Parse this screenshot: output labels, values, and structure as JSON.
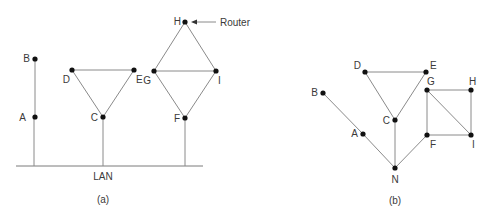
{
  "panels": [
    {
      "id": "a",
      "caption": "(a)",
      "lan_label": "LAN",
      "router_label": "Router",
      "nodes": [
        {
          "label": "A",
          "x": 35,
          "y": 117
        },
        {
          "label": "B",
          "x": 35,
          "y": 59
        },
        {
          "label": "C",
          "x": 103,
          "y": 117
        },
        {
          "label": "D",
          "x": 72,
          "y": 70
        },
        {
          "label": "E",
          "x": 134,
          "y": 70
        },
        {
          "label": "F",
          "x": 185,
          "y": 118
        },
        {
          "label": "G",
          "x": 154,
          "y": 71
        },
        {
          "label": "H",
          "x": 185,
          "y": 22
        },
        {
          "label": "I",
          "x": 216,
          "y": 71
        }
      ],
      "edges": [
        [
          "A",
          "B"
        ],
        [
          "C",
          "D"
        ],
        [
          "C",
          "E"
        ],
        [
          "D",
          "E"
        ],
        [
          "F",
          "G"
        ],
        [
          "F",
          "I"
        ],
        [
          "G",
          "H"
        ],
        [
          "H",
          "I"
        ],
        [
          "G",
          "I"
        ]
      ],
      "lan_attached": [
        "A",
        "C",
        "F"
      ]
    },
    {
      "id": "b",
      "caption": "(b)",
      "nodes": [
        {
          "label": "A",
          "x": 363,
          "y": 134
        },
        {
          "label": "B",
          "x": 323,
          "y": 93
        },
        {
          "label": "C",
          "x": 395,
          "y": 120
        },
        {
          "label": "D",
          "x": 365,
          "y": 72
        },
        {
          "label": "E",
          "x": 426,
          "y": 72
        },
        {
          "label": "F",
          "x": 427,
          "y": 135
        },
        {
          "label": "G",
          "x": 427,
          "y": 90
        },
        {
          "label": "H",
          "x": 471,
          "y": 90
        },
        {
          "label": "I",
          "x": 471,
          "y": 135
        },
        {
          "label": "N",
          "x": 395,
          "y": 168
        }
      ],
      "edges": [
        [
          "B",
          "A"
        ],
        [
          "A",
          "N"
        ],
        [
          "C",
          "N"
        ],
        [
          "F",
          "N"
        ],
        [
          "C",
          "D"
        ],
        [
          "C",
          "E"
        ],
        [
          "D",
          "E"
        ],
        [
          "G",
          "H"
        ],
        [
          "H",
          "I"
        ],
        [
          "F",
          "I"
        ],
        [
          "F",
          "G"
        ],
        [
          "G",
          "I"
        ]
      ]
    }
  ]
}
